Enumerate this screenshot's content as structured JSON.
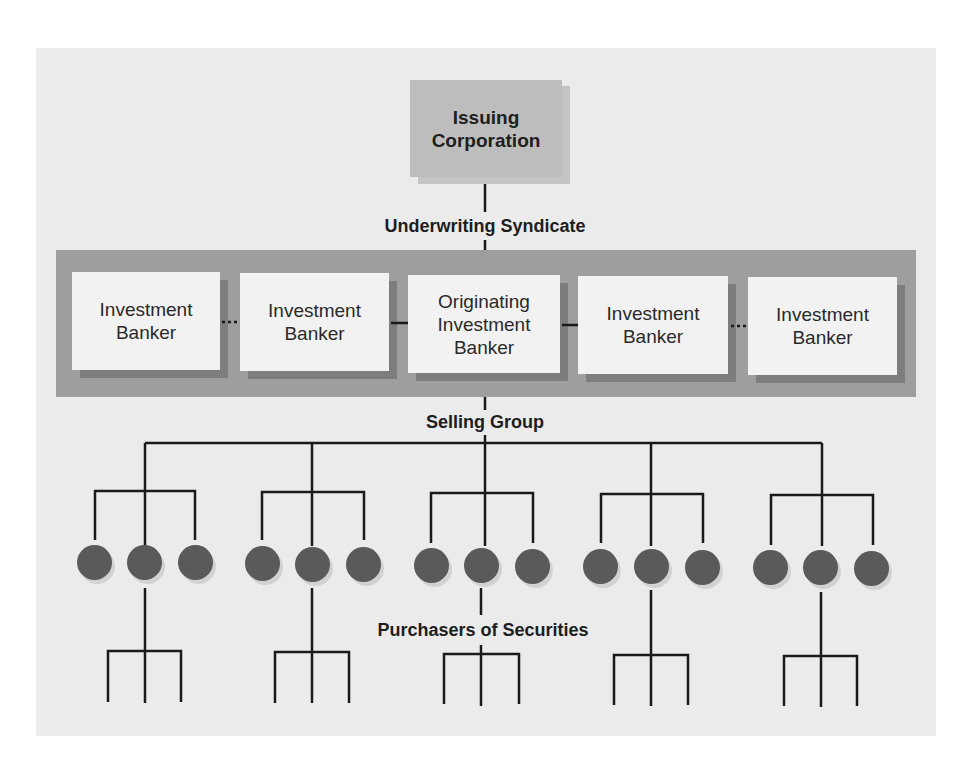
{
  "diagram": {
    "issuer": {
      "line1": "Issuing",
      "line2": "Corporation"
    },
    "labels": {
      "underwriting": "Underwriting Syndicate",
      "selling": "Selling Group",
      "purchasers": "Purchasers of Securities"
    },
    "bankers": [
      {
        "lines": [
          "Investment",
          "Banker"
        ],
        "role": "member"
      },
      {
        "lines": [
          "Investment",
          "Banker"
        ],
        "role": "member"
      },
      {
        "lines": [
          "Originating",
          "Investment",
          "Banker"
        ],
        "role": "originator"
      },
      {
        "lines": [
          "Investment",
          "Banker"
        ],
        "role": "member"
      },
      {
        "lines": [
          "Investment",
          "Banker"
        ],
        "role": "member"
      }
    ],
    "connections": {
      "banker1_banker2": "dotted",
      "banker2_originator": "solid",
      "originator_banker4": "solid",
      "banker4_banker5": "dotted"
    },
    "selling_group": {
      "groups": 5,
      "dealers_per_group": 3,
      "purchasers_per_group": 3
    },
    "colors": {
      "panel": "#ebebeb",
      "issuer_box": "#bdbdbd",
      "syndicate_band": "#9e9e9e",
      "banker_box": "#f2f2f2",
      "dealer_dot": "#5a5a5a",
      "line": "#1a1a1a"
    }
  }
}
